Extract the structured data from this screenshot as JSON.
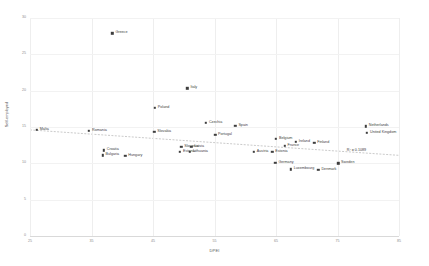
{
  "chart_data": {
    "type": "scatter",
    "title": "",
    "xlabel": "DPEI",
    "ylabel": "Self-employed",
    "xlim": [
      25,
      85
    ],
    "ylim": [
      0,
      30
    ],
    "xticks": [
      "25",
      "35",
      "45",
      "55",
      "65",
      "75",
      "85"
    ],
    "yticks": [
      "0",
      "5",
      "10",
      "15",
      "20",
      "25",
      "30"
    ],
    "grid": true,
    "legend": "none",
    "annotation": "R² = 0.1089",
    "trendline": {
      "type": "linear",
      "x_start": 25,
      "y_start": 14.6,
      "x_end": 85,
      "y_end": 11.1
    },
    "points": [
      {
        "label": "Greece",
        "x": 38.4,
        "y": 27.9,
        "label_pos": "right"
      },
      {
        "label": "Italy",
        "x": 50.6,
        "y": 20.3,
        "label_pos": "right"
      },
      {
        "label": "Poland",
        "x": 45.3,
        "y": 17.6,
        "label_pos": "right"
      },
      {
        "label": "Czechia",
        "x": 53.6,
        "y": 15.6,
        "label_pos": "right"
      },
      {
        "label": "Spain",
        "x": 58.4,
        "y": 15.2,
        "label_pos": "right"
      },
      {
        "label": "Netherlands",
        "x": 79.6,
        "y": 15.1,
        "label_pos": "right"
      },
      {
        "label": "United Kingdom",
        "x": 79.8,
        "y": 14.2,
        "label_pos": "right"
      },
      {
        "label": "Malta",
        "x": 26.1,
        "y": 14.6,
        "label_pos": "right"
      },
      {
        "label": "Romania",
        "x": 34.6,
        "y": 14.5,
        "label_pos": "right"
      },
      {
        "label": "Slovakia",
        "x": 45.2,
        "y": 14.3,
        "label_pos": "right"
      },
      {
        "label": "Portugal",
        "x": 55.1,
        "y": 13.9,
        "label_pos": "right"
      },
      {
        "label": "Belgium",
        "x": 65.0,
        "y": 13.4,
        "label_pos": "right"
      },
      {
        "label": "Ireland",
        "x": 68.2,
        "y": 13.0,
        "label_pos": "right"
      },
      {
        "label": "Finland",
        "x": 71.2,
        "y": 12.8,
        "label_pos": "right"
      },
      {
        "label": "France",
        "x": 66.4,
        "y": 12.4,
        "label_pos": "right"
      },
      {
        "label": "Slovenia",
        "x": 49.6,
        "y": 12.3,
        "label_pos": "right"
      },
      {
        "label": "Latvia",
        "x": 51.2,
        "y": 12.3,
        "label_pos": "right"
      },
      {
        "label": "Estonia",
        "x": 49.4,
        "y": 11.6,
        "label_pos": "right"
      },
      {
        "label": "Lithuania",
        "x": 51.0,
        "y": 11.6,
        "label_pos": "right"
      },
      {
        "label": "Austria",
        "x": 61.4,
        "y": 11.6,
        "label_pos": "right"
      },
      {
        "label": "Estonia ",
        "x": 64.4,
        "y": 11.6,
        "label_pos": "right"
      },
      {
        "label": "Croatia",
        "x": 37.0,
        "y": 11.8,
        "label_pos": "right"
      },
      {
        "label": "Bulgaria",
        "x": 36.8,
        "y": 11.1,
        "label_pos": "right"
      },
      {
        "label": "Hungary",
        "x": 40.5,
        "y": 11.0,
        "label_pos": "right"
      },
      {
        "label": "Germany",
        "x": 64.9,
        "y": 10.1,
        "label_pos": "right"
      },
      {
        "label": "Sweden",
        "x": 75.1,
        "y": 10.0,
        "label_pos": "right"
      },
      {
        "label": "Luxembourg",
        "x": 67.4,
        "y": 9.2,
        "label_pos": "right"
      },
      {
        "label": "Denmark",
        "x": 71.9,
        "y": 9.1,
        "label_pos": "right"
      }
    ]
  }
}
